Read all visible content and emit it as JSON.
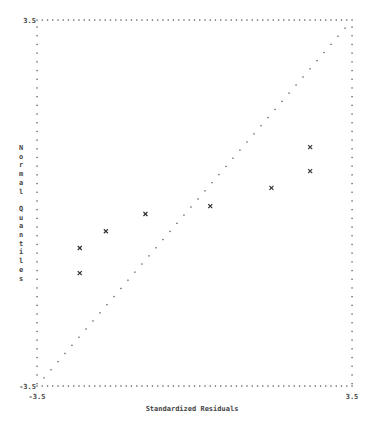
{
  "chart_data": {
    "type": "scatter",
    "title": "",
    "xlabel": "Standardized Residuals",
    "ylabel": "Normal Quantiles",
    "xlim": [
      -3.5,
      3.5
    ],
    "ylim": [
      -3.5,
      3.5
    ],
    "x_tick_labels": [
      "-3.5",
      "3.5"
    ],
    "y_tick_labels": [
      "3.5",
      "-3.5"
    ],
    "grid": false,
    "frame_style": "dotted",
    "marker": "x",
    "reference_line": {
      "from": [
        -3.5,
        -3.5
      ],
      "to": [
        3.5,
        3.5
      ],
      "style": "dotted"
    },
    "series": [
      {
        "name": "observations",
        "points": [
          {
            "x": -2.55,
            "y": -0.86
          },
          {
            "x": -2.55,
            "y": -1.34
          },
          {
            "x": -1.97,
            "y": -0.54
          },
          {
            "x": -1.09,
            "y": -0.21
          },
          {
            "x": 0.35,
            "y": -0.06
          },
          {
            "x": 1.71,
            "y": 0.29
          },
          {
            "x": 2.57,
            "y": 1.07
          },
          {
            "x": 2.57,
            "y": 0.61
          }
        ]
      }
    ]
  },
  "labels": {
    "x_min": "-3.5",
    "x_max": "3.5",
    "y_max": "3.5",
    "y_min": "-3.5",
    "x_axis_title": "Standardized Residuals",
    "y_axis_title": "Normal Quantiles"
  }
}
